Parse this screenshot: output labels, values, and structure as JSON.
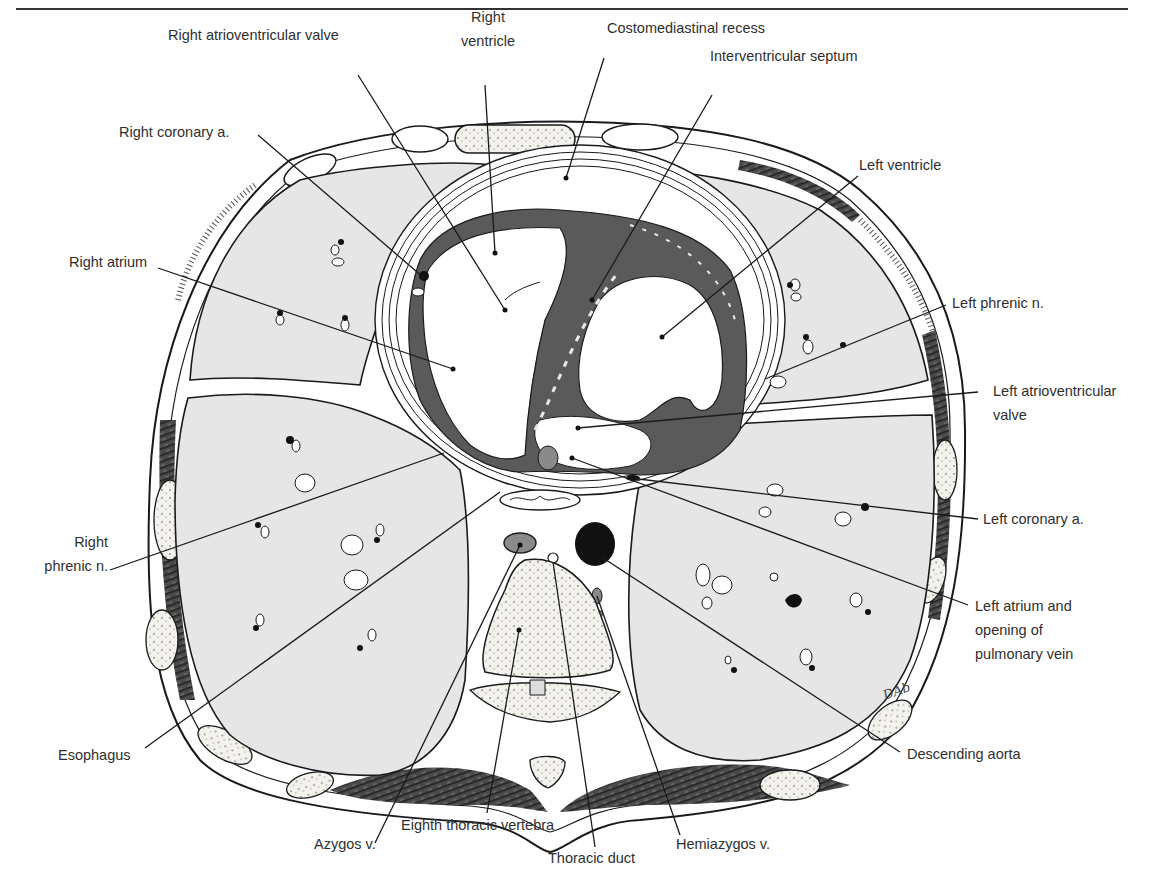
{
  "figure": {
    "signature": "DAb",
    "colors": {
      "lung_fill": "#e6e6e6",
      "myocardium": "#5a5a5a",
      "muscle": "#3e3e3e",
      "aorta": "#111111",
      "line": "#1a1a1a",
      "text": "#2f2f2f"
    }
  },
  "labels": {
    "right_atrioventricular_valve": "Right atrioventricular valve",
    "right_ventricle_1": "Right",
    "right_ventricle_2": "ventricle",
    "costomediastinal_recess": "Costomediastinal recess",
    "interventricular_septum": "Interventricular septum",
    "right_coronary_a": "Right coronary a.",
    "left_ventricle": "Left ventricle",
    "right_atrium": "Right atrium",
    "left_phrenic_n": "Left phrenic n.",
    "left_av_valve_1": "Left atrioventricular",
    "left_av_valve_2": "valve",
    "left_coronary_a": "Left coronary a.",
    "right_phrenic_n_1": "Right",
    "right_phrenic_n_2": "phrenic n.",
    "left_atrium_1": "Left atrium and",
    "left_atrium_2": "opening of",
    "left_atrium_3": "pulmonary vein",
    "esophagus": "Esophagus",
    "descending_aorta": "Descending aorta",
    "azygos_v": "Azygos v.",
    "eighth_thoracic_vertebra": "Eighth thoracic vertebra",
    "thoracic_duct": "Thoracic duct",
    "hemiazygos_v": "Hemiazygos v."
  }
}
